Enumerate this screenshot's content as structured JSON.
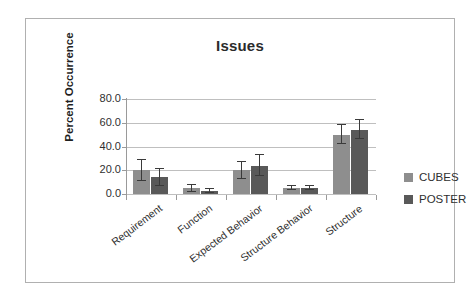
{
  "chart_data": {
    "type": "bar",
    "title": "Issues",
    "xlabel": "",
    "ylabel": "Percent Occurrence",
    "ylim": [
      0,
      80
    ],
    "yticks": [
      "0.0",
      "20.0",
      "40.0",
      "60.0",
      "80.0"
    ],
    "ytick_values": [
      0,
      20,
      40,
      60,
      80
    ],
    "grid": true,
    "legend_position": "right",
    "categories": [
      "Requirement",
      "Function",
      "Expected Behavior",
      "Structure Behavior",
      "Structure"
    ],
    "series": [
      {
        "name": "CUBES",
        "color": "#8e8e8e",
        "values": [
          20,
          5,
          20,
          5,
          50
        ],
        "errors": [
          9,
          3,
          7,
          2,
          8
        ]
      },
      {
        "name": "POSTER",
        "color": "#595959",
        "values": [
          14,
          2.5,
          24,
          5,
          54
        ],
        "errors": [
          7,
          1.5,
          9,
          2,
          8
        ]
      }
    ]
  },
  "legend": {
    "entries": [
      {
        "label": "CUBES"
      },
      {
        "label": "POSTER"
      }
    ]
  }
}
